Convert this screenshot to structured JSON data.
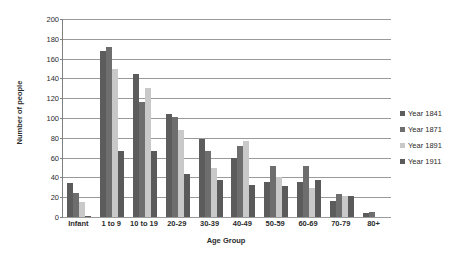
{
  "chart_data": {
    "type": "bar",
    "title": "",
    "xlabel": "Age Group",
    "ylabel": "Number of people",
    "ylim": [
      0,
      200
    ],
    "yticks": [
      0,
      20,
      40,
      60,
      80,
      100,
      120,
      140,
      160,
      180,
      200
    ],
    "grid": true,
    "legend_position": "right",
    "categories": [
      "Infant",
      "1 to 9",
      "10 to 19",
      "20-29",
      "30-39",
      "40-49",
      "50-59",
      "60-69",
      "70-79",
      "80+"
    ],
    "series": [
      {
        "name": "Year 1841",
        "color": "#5c5c5c",
        "values": [
          34,
          168,
          144,
          104,
          79,
          60,
          35,
          35,
          16,
          4
        ]
      },
      {
        "name": "Year 1871",
        "color": "#6e6e6e",
        "values": [
          24,
          172,
          116,
          101,
          67,
          72,
          52,
          52,
          23,
          5
        ]
      },
      {
        "name": "Year 1891",
        "color": "#c9c9c9",
        "values": [
          15,
          150,
          130,
          88,
          50,
          77,
          40,
          29,
          21,
          0
        ]
      },
      {
        "name": "Year 1911",
        "color": "#5a5a5a",
        "values": [
          1,
          67,
          67,
          43,
          37,
          32,
          31,
          37,
          21,
          0
        ]
      }
    ]
  }
}
